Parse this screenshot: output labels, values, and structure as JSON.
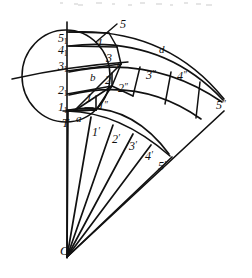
{
  "figure": {
    "canvas": {
      "width": 252,
      "height": 278
    },
    "ink_color": "#111111",
    "background_color": "#ffffff",
    "apex_label": "O",
    "tangent_point_label": "T"
  },
  "labels": [
    {
      "name": "label-O",
      "text": "O",
      "prime": "",
      "sub": "",
      "x": 60,
      "y": 244,
      "size": 13
    },
    {
      "name": "label-T",
      "text": "T",
      "prime": "",
      "sub": "",
      "x": 62,
      "y": 117,
      "size": 12
    },
    {
      "name": "label-a",
      "text": "a",
      "prime": "",
      "sub": "",
      "x": 76,
      "y": 113,
      "size": 11
    },
    {
      "name": "label-b",
      "text": "b",
      "prime": "",
      "sub": "",
      "x": 90,
      "y": 72,
      "size": 11
    },
    {
      "name": "label-c",
      "text": "c",
      "prime": "",
      "sub": "",
      "x": 117,
      "y": 58,
      "size": 11
    },
    {
      "name": "label-d",
      "text": "d",
      "prime": "",
      "sub": "",
      "x": 159,
      "y": 44,
      "size": 11
    },
    {
      "name": "label-1-sub1",
      "text": "1",
      "prime": "",
      "sub": "1",
      "x": 58,
      "y": 101,
      "size": 12
    },
    {
      "name": "label-2-sub1",
      "text": "2",
      "prime": "",
      "sub": "1",
      "x": 58,
      "y": 84,
      "size": 12
    },
    {
      "name": "label-3-sub1",
      "text": "3",
      "prime": "",
      "sub": "1",
      "x": 58,
      "y": 60,
      "size": 12
    },
    {
      "name": "label-4-sub1",
      "text": "4",
      "prime": "",
      "sub": "1",
      "x": 58,
      "y": 44,
      "size": 12
    },
    {
      "name": "label-5-sub1",
      "text": "5",
      "prime": "",
      "sub": "1",
      "x": 58,
      "y": 32,
      "size": 12
    },
    {
      "name": "label-1",
      "text": "1",
      "prime": "",
      "sub": "",
      "x": 86,
      "y": 92,
      "size": 12
    },
    {
      "name": "label-2",
      "text": "2",
      "prime": "",
      "sub": "",
      "x": 105,
      "y": 74,
      "size": 12
    },
    {
      "name": "label-3",
      "text": "3",
      "prime": "",
      "sub": "",
      "x": 106,
      "y": 52,
      "size": 12
    },
    {
      "name": "label-4",
      "text": "4",
      "prime": "",
      "sub": "",
      "x": 96,
      "y": 37,
      "size": 12
    },
    {
      "name": "label-5-leader",
      "text": "5",
      "prime": "",
      "sub": "",
      "x": 120,
      "y": 18,
      "size": 12
    },
    {
      "name": "label-1-prime2",
      "text": "1",
      "prime": "″",
      "sub": "",
      "x": 98,
      "y": 100,
      "size": 12
    },
    {
      "name": "label-2-prime2",
      "text": "2",
      "prime": "″",
      "sub": "",
      "x": 118,
      "y": 82,
      "size": 12
    },
    {
      "name": "label-3-prime2",
      "text": "3",
      "prime": "″",
      "sub": "",
      "x": 146,
      "y": 69,
      "size": 12
    },
    {
      "name": "label-4-prime2",
      "text": "4",
      "prime": "″",
      "sub": "",
      "x": 177,
      "y": 70,
      "size": 12
    },
    {
      "name": "label-5-prime2",
      "text": "5",
      "prime": "″",
      "sub": "",
      "x": 216,
      "y": 99,
      "size": 12
    },
    {
      "name": "label-1-prime",
      "text": "1",
      "prime": "′",
      "sub": "",
      "x": 92,
      "y": 126,
      "size": 12
    },
    {
      "name": "label-2-prime",
      "text": "2",
      "prime": "′",
      "sub": "",
      "x": 112,
      "y": 133,
      "size": 12
    },
    {
      "name": "label-3-prime",
      "text": "3",
      "prime": "′",
      "sub": "",
      "x": 129,
      "y": 140,
      "size": 12
    },
    {
      "name": "label-4-prime",
      "text": "4",
      "prime": "′",
      "sub": "",
      "x": 145,
      "y": 150,
      "size": 12
    },
    {
      "name": "label-5-prime",
      "text": "5",
      "prime": "′",
      "sub": "",
      "x": 158,
      "y": 160,
      "size": 12
    }
  ],
  "geometry": {
    "circle": {
      "name": "base-circle",
      "cx": 66,
      "cy": 76,
      "rx": 44,
      "ry": 46
    },
    "vertical_axis": {
      "name": "vertical-axis",
      "x": 67,
      "y1": 22,
      "y2": 258
    },
    "left_transversal": {
      "name": "left-transversal",
      "x1": 12,
      "y1": 79,
      "x2": 128,
      "y2": 62
    },
    "apex": {
      "x": 67,
      "y": 257
    },
    "rays": [
      {
        "name": "ray-1",
        "x2": 68,
        "y2": 112
      },
      {
        "name": "ray-2",
        "x2": 92,
        "y2": 118
      },
      {
        "name": "ray-3",
        "x2": 114,
        "y2": 126
      },
      {
        "name": "ray-4",
        "x2": 134,
        "y2": 135
      },
      {
        "name": "ray-5",
        "x2": 152,
        "y2": 146
      },
      {
        "name": "ray-6",
        "x2": 175,
        "y2": 158
      },
      {
        "name": "ray-7",
        "x2": 223,
        "y2": 112
      }
    ],
    "lower_arc": {
      "name": "lower-arc",
      "d": "M 67 112 Q 118 113 168 157"
    },
    "upper_arcs": [
      {
        "name": "upper-arc-a",
        "d": "M 69 112 Q 130 100 167 155"
      },
      {
        "name": "upper-arc-b",
        "d": "M 69 96  Q 140 78 200 120"
      },
      {
        "name": "upper-arc-c",
        "d": "M 69 73  Q 150 55 221 103"
      },
      {
        "name": "upper-arc-d",
        "d": "M 69 47  Q 160 36 222 101"
      },
      {
        "name": "upper-arc-e",
        "d": "M 69 33  Q 165 28 223 100"
      }
    ],
    "ladder_lines": [
      {
        "name": "ladder-1",
        "x1": 67,
        "y1": 110,
        "x2": 96,
        "y2": 110
      },
      {
        "name": "ladder-2",
        "x1": 67,
        "y1": 94,
        "x2": 113,
        "y2": 86
      },
      {
        "name": "ladder-3",
        "x1": 67,
        "y1": 71,
        "x2": 122,
        "y2": 64
      },
      {
        "name": "ladder-4",
        "x1": 67,
        "y1": 46,
        "x2": 118,
        "y2": 47
      },
      {
        "name": "ladder-5",
        "x1": 67,
        "y1": 32,
        "x2": 110,
        "y2": 33
      }
    ]
  },
  "meta": {
    "figure_kind": "line-drawing",
    "has_scan_noise": true
  }
}
